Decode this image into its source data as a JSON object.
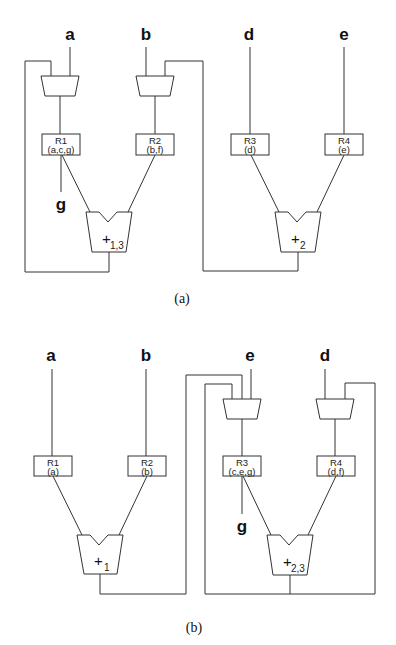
{
  "figure": {
    "part_a": {
      "caption": "(a)",
      "inputs": [
        "a",
        "b",
        "d",
        "e"
      ],
      "output_label": "g",
      "registers": [
        {
          "name": "R1",
          "contents": "(a,c,g)"
        },
        {
          "name": "R2",
          "contents": "(b,f)"
        },
        {
          "name": "R3",
          "contents": "(d)"
        },
        {
          "name": "R4",
          "contents": "(e)"
        }
      ],
      "adders": [
        {
          "symbol": "+",
          "subscript": "1,3"
        },
        {
          "symbol": "+",
          "subscript": "2"
        }
      ]
    },
    "part_b": {
      "caption": "(b)",
      "inputs": [
        "a",
        "b",
        "e",
        "d"
      ],
      "output_label": "g",
      "registers": [
        {
          "name": "R1",
          "contents": "(a)"
        },
        {
          "name": "R2",
          "contents": "(b)"
        },
        {
          "name": "R3",
          "contents": "(c,e,g)"
        },
        {
          "name": "R4",
          "contents": "(d,f)"
        }
      ],
      "adders": [
        {
          "symbol": "+",
          "subscript": "1"
        },
        {
          "symbol": "+",
          "subscript": "2,3"
        }
      ]
    }
  }
}
